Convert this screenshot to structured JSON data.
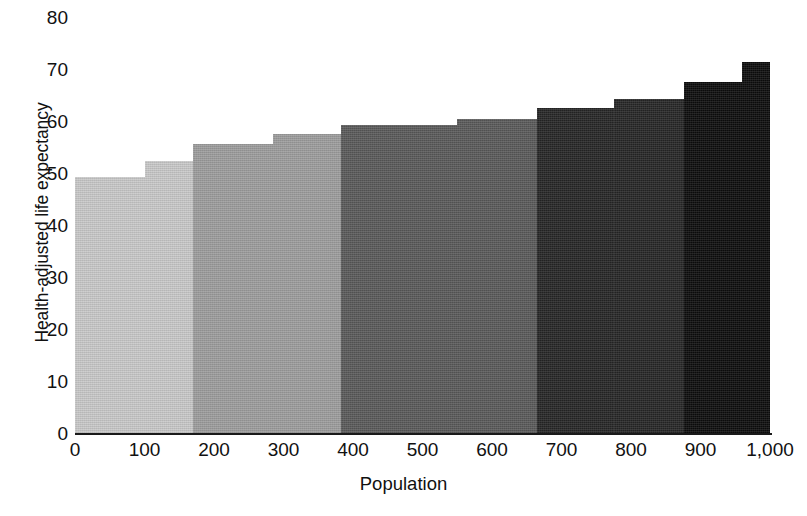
{
  "chart_data": {
    "type": "bar",
    "title": "",
    "subtitle": "",
    "xlabel": "Population",
    "ylabel": "Health-adjusted life expectancy",
    "xlim": [
      0,
      1000
    ],
    "ylim": [
      0,
      80
    ],
    "grid": false,
    "legend": null,
    "orientation": "vertical",
    "variable_width": true,
    "xticks": [
      "0",
      "100",
      "200",
      "300",
      "400",
      "500",
      "600",
      "700",
      "800",
      "900",
      "1,000"
    ],
    "xtick_values": [
      0,
      100,
      200,
      300,
      400,
      500,
      600,
      700,
      800,
      900,
      1000
    ],
    "yticks": [
      "0",
      "10",
      "20",
      "30",
      "40",
      "50",
      "60",
      "70",
      "80"
    ],
    "ytick_values": [
      0,
      10,
      20,
      30,
      40,
      50,
      60,
      70,
      80
    ],
    "note": "Variable-width step bars; cumulative population on x-axis, each segment spans [x_start, x_end].",
    "bars": [
      {
        "label": "segment-1",
        "x_start": 0,
        "x_end": 100,
        "value": 49.5,
        "color": "#c9c9c9"
      },
      {
        "label": "segment-2",
        "x_start": 100,
        "x_end": 170,
        "value": 52.5,
        "color": "#c9c9c9"
      },
      {
        "label": "segment-3",
        "x_start": 170,
        "x_end": 285,
        "value": 55.8,
        "color": "#9d9d9d"
      },
      {
        "label": "segment-4",
        "x_start": 285,
        "x_end": 383,
        "value": 57.7,
        "color": "#9d9d9d"
      },
      {
        "label": "segment-5",
        "x_start": 383,
        "x_end": 550,
        "value": 59.5,
        "color": "#5a5a5a"
      },
      {
        "label": "segment-6",
        "x_start": 550,
        "x_end": 665,
        "value": 60.6,
        "color": "#5a5a5a"
      },
      {
        "label": "segment-7",
        "x_start": 665,
        "x_end": 775,
        "value": 62.6,
        "color": "#262626"
      },
      {
        "label": "segment-8",
        "x_start": 775,
        "x_end": 876,
        "value": 64.4,
        "color": "#262626"
      },
      {
        "label": "segment-9",
        "x_start": 876,
        "x_end": 960,
        "value": 67.6,
        "color": "#0d0d0d"
      },
      {
        "label": "segment-10",
        "x_start": 960,
        "x_end": 1000,
        "value": 71.5,
        "color": "#0d0d0d"
      }
    ],
    "band_colors": [
      "#c9c9c9",
      "#9d9d9d",
      "#5a5a5a",
      "#262626",
      "#0d0d0d"
    ]
  },
  "caption": {
    "fragment": ""
  }
}
